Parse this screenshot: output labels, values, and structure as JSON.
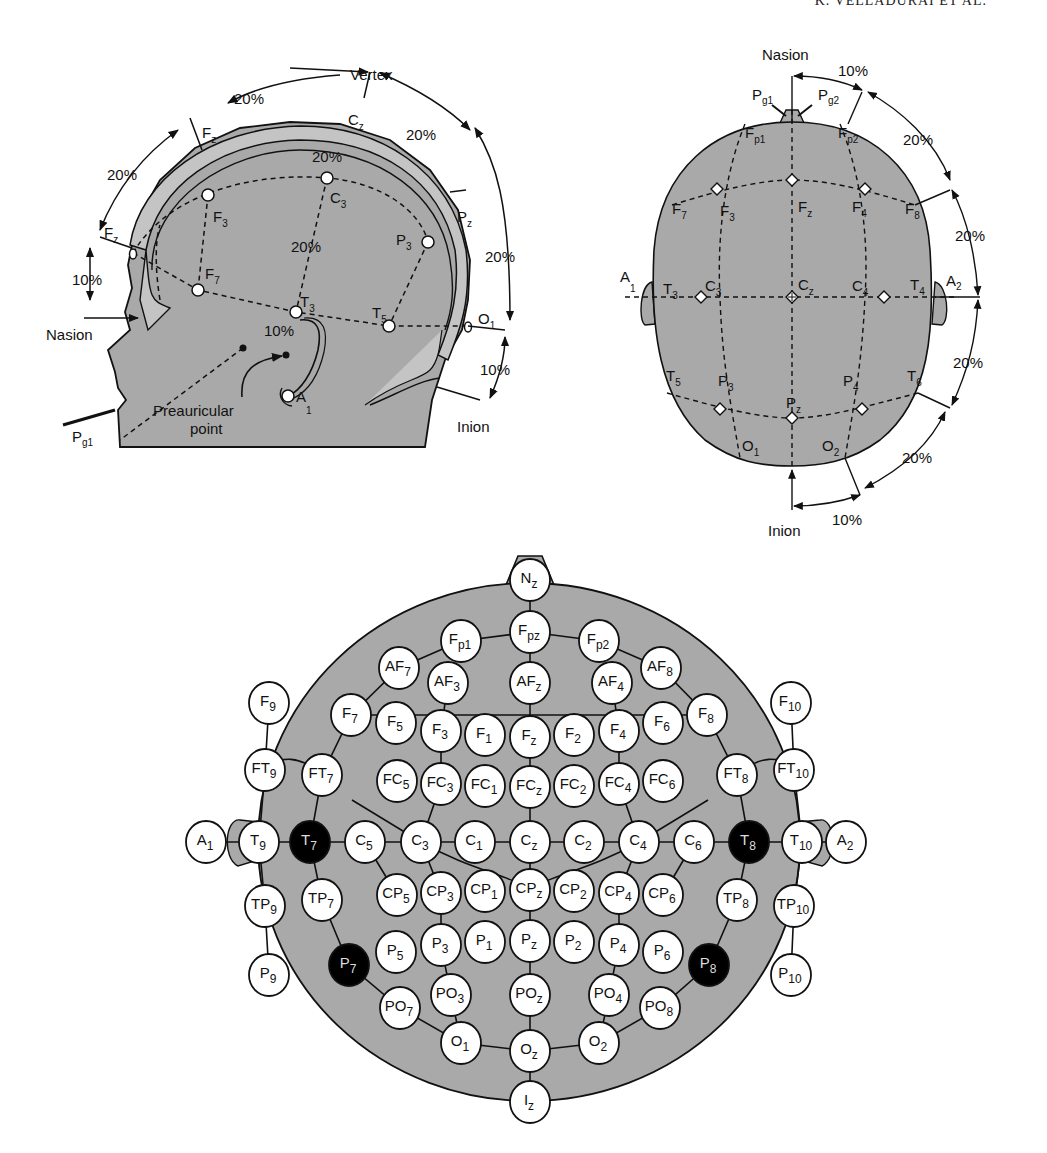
{
  "running_head": "K. VELLADURAI ET AL.",
  "colors": {
    "head_fill": "#a9a9a9",
    "head_fill_light": "#c4c4c4",
    "outline": "#111111",
    "electrode_fill": "#ffffff",
    "electrode_highlight": "#000000"
  },
  "side_view": {
    "title": "Vertex",
    "labels": {
      "vertex": "Vertex",
      "nasion": "Nasion",
      "inion": "Inion",
      "preauricular": "Preauricular",
      "preauricular2": "point",
      "pg1": "P",
      "pg1_sub": "g1",
      "a1": "A",
      "a1_sub": "1"
    },
    "percent_labels": [
      "20%",
      "20%",
      "20%",
      "20%",
      "10%",
      "20%",
      "20%",
      "10%",
      "10%"
    ],
    "electrodes": [
      {
        "id": "Fz_top",
        "label": "F",
        "sub": "z"
      },
      {
        "id": "Cz",
        "label": "C",
        "sub": "z"
      },
      {
        "id": "Pz",
        "label": "P",
        "sub": "z"
      },
      {
        "id": "Fpz",
        "label": "F",
        "sub": "z"
      },
      {
        "id": "F3",
        "label": "F",
        "sub": "3"
      },
      {
        "id": "C3",
        "label": "C",
        "sub": "3"
      },
      {
        "id": "P3",
        "label": "P",
        "sub": "3"
      },
      {
        "id": "F7",
        "label": "F",
        "sub": "7"
      },
      {
        "id": "T3",
        "label": "T",
        "sub": "3"
      },
      {
        "id": "T5",
        "label": "T",
        "sub": "5"
      },
      {
        "id": "O1",
        "label": "O",
        "sub": "1"
      }
    ]
  },
  "top_view": {
    "labels": {
      "nasion": "Nasion",
      "inion": "Inion",
      "pg1": "P",
      "pg1_sub": "g1",
      "pg2": "P",
      "pg2_sub": "g2",
      "a1": "A",
      "a1_sub": "1",
      "a2": "A",
      "a2_sub": "2"
    },
    "percent_labels": [
      "10%",
      "20%",
      "20%",
      "20%",
      "20%",
      "10%"
    ],
    "electrodes": [
      {
        "label": "F",
        "sub": "p1"
      },
      {
        "label": "F",
        "sub": "p2"
      },
      {
        "label": "F",
        "sub": "7"
      },
      {
        "label": "F",
        "sub": "3"
      },
      {
        "label": "F",
        "sub": "z"
      },
      {
        "label": "F",
        "sub": "4"
      },
      {
        "label": "F",
        "sub": "8"
      },
      {
        "label": "T",
        "sub": "3"
      },
      {
        "label": "C",
        "sub": "3"
      },
      {
        "label": "C",
        "sub": "z"
      },
      {
        "label": "C",
        "sub": "4"
      },
      {
        "label": "T",
        "sub": "4"
      },
      {
        "label": "T",
        "sub": "5"
      },
      {
        "label": "P",
        "sub": "3"
      },
      {
        "label": "P",
        "sub": "z"
      },
      {
        "label": "P",
        "sub": "4"
      },
      {
        "label": "T",
        "sub": "6"
      },
      {
        "label": "O",
        "sub": "1"
      },
      {
        "label": "O",
        "sub": "2"
      }
    ]
  },
  "ten_ten_map": {
    "electrodes": [
      {
        "l": "N",
        "s": "z",
        "x": 530,
        "y": 580
      },
      {
        "l": "F",
        "s": "pz",
        "x": 530,
        "y": 632
      },
      {
        "l": "F",
        "s": "p1",
        "x": 461,
        "y": 641
      },
      {
        "l": "F",
        "s": "p2",
        "x": 599,
        "y": 641
      },
      {
        "l": "AF",
        "s": "7",
        "x": 399,
        "y": 668
      },
      {
        "l": "AF",
        "s": "3",
        "x": 448,
        "y": 683
      },
      {
        "l": "AF",
        "s": "z",
        "x": 530,
        "y": 683
      },
      {
        "l": "AF",
        "s": "4",
        "x": 612,
        "y": 683
      },
      {
        "l": "AF",
        "s": "8",
        "x": 661,
        "y": 668
      },
      {
        "l": "F",
        "s": "9",
        "x": 269,
        "y": 703
      },
      {
        "l": "F",
        "s": "7",
        "x": 351,
        "y": 715
      },
      {
        "l": "F",
        "s": "5",
        "x": 396,
        "y": 723
      },
      {
        "l": "F",
        "s": "3",
        "x": 441,
        "y": 731
      },
      {
        "l": "F",
        "s": "1",
        "x": 485,
        "y": 735
      },
      {
        "l": "F",
        "s": "z",
        "x": 530,
        "y": 737
      },
      {
        "l": "F",
        "s": "2",
        "x": 574,
        "y": 735
      },
      {
        "l": "F",
        "s": "4",
        "x": 619,
        "y": 731
      },
      {
        "l": "F",
        "s": "6",
        "x": 663,
        "y": 723
      },
      {
        "l": "F",
        "s": "8",
        "x": 707,
        "y": 715
      },
      {
        "l": "F",
        "s": "10",
        "x": 791,
        "y": 703
      },
      {
        "l": "FT",
        "s": "9",
        "x": 265,
        "y": 770
      },
      {
        "l": "FT",
        "s": "7",
        "x": 322,
        "y": 775
      },
      {
        "l": "FC",
        "s": "5",
        "x": 397,
        "y": 781
      },
      {
        "l": "FC",
        "s": "3",
        "x": 441,
        "y": 784
      },
      {
        "l": "FC",
        "s": "1",
        "x": 485,
        "y": 786
      },
      {
        "l": "FC",
        "s": "z",
        "x": 530,
        "y": 787
      },
      {
        "l": "FC",
        "s": "2",
        "x": 574,
        "y": 786
      },
      {
        "l": "FC",
        "s": "4",
        "x": 619,
        "y": 784
      },
      {
        "l": "FC",
        "s": "6",
        "x": 663,
        "y": 781
      },
      {
        "l": "FT",
        "s": "8",
        "x": 737,
        "y": 775
      },
      {
        "l": "FT",
        "s": "10",
        "x": 794,
        "y": 770
      },
      {
        "l": "A",
        "s": "1",
        "x": 206,
        "y": 842
      },
      {
        "l": "T",
        "s": "9",
        "x": 259,
        "y": 842
      },
      {
        "l": "T",
        "s": "7",
        "x": 310,
        "y": 842,
        "dark": true
      },
      {
        "l": "C",
        "s": "5",
        "x": 365,
        "y": 842
      },
      {
        "l": "C",
        "s": "3",
        "x": 421,
        "y": 842
      },
      {
        "l": "C",
        "s": "1",
        "x": 475,
        "y": 842
      },
      {
        "l": "C",
        "s": "z",
        "x": 530,
        "y": 842
      },
      {
        "l": "C",
        "s": "2",
        "x": 584,
        "y": 842
      },
      {
        "l": "C",
        "s": "4",
        "x": 639,
        "y": 842
      },
      {
        "l": "C",
        "s": "6",
        "x": 694,
        "y": 842
      },
      {
        "l": "T",
        "s": "8",
        "x": 749,
        "y": 842,
        "dark": true
      },
      {
        "l": "T",
        "s": "10",
        "x": 802,
        "y": 842
      },
      {
        "l": "A",
        "s": "2",
        "x": 846,
        "y": 842
      },
      {
        "l": "TP",
        "s": "9",
        "x": 265,
        "y": 906
      },
      {
        "l": "TP",
        "s": "7",
        "x": 322,
        "y": 900
      },
      {
        "l": "CP",
        "s": "5",
        "x": 397,
        "y": 895
      },
      {
        "l": "CP",
        "s": "3",
        "x": 441,
        "y": 893
      },
      {
        "l": "CP",
        "s": "1",
        "x": 485,
        "y": 891
      },
      {
        "l": "CP",
        "s": "z",
        "x": 530,
        "y": 890
      },
      {
        "l": "CP",
        "s": "2",
        "x": 574,
        "y": 891
      },
      {
        "l": "CP",
        "s": "4",
        "x": 619,
        "y": 893
      },
      {
        "l": "CP",
        "s": "6",
        "x": 663,
        "y": 895
      },
      {
        "l": "TP",
        "s": "8",
        "x": 737,
        "y": 900
      },
      {
        "l": "TP",
        "s": "10",
        "x": 794,
        "y": 906
      },
      {
        "l": "P",
        "s": "7",
        "x": 349,
        "y": 965,
        "dark": true
      },
      {
        "l": "P",
        "s": "5",
        "x": 396,
        "y": 952
      },
      {
        "l": "P",
        "s": "3",
        "x": 441,
        "y": 945
      },
      {
        "l": "P",
        "s": "1",
        "x": 485,
        "y": 942
      },
      {
        "l": "P",
        "s": "z",
        "x": 530,
        "y": 941
      },
      {
        "l": "P",
        "s": "2",
        "x": 574,
        "y": 942
      },
      {
        "l": "P",
        "s": "4",
        "x": 619,
        "y": 945
      },
      {
        "l": "P",
        "s": "6",
        "x": 663,
        "y": 952
      },
      {
        "l": "P",
        "s": "8",
        "x": 709,
        "y": 965,
        "dark": true
      },
      {
        "l": "P",
        "s": "9",
        "x": 269,
        "y": 975
      },
      {
        "l": "P",
        "s": "10",
        "x": 791,
        "y": 975
      },
      {
        "l": "PO",
        "s": "7",
        "x": 400,
        "y": 1008
      },
      {
        "l": "PO",
        "s": "3",
        "x": 451,
        "y": 995
      },
      {
        "l": "PO",
        "s": "z",
        "x": 530,
        "y": 995
      },
      {
        "l": "PO",
        "s": "4",
        "x": 609,
        "y": 995
      },
      {
        "l": "PO",
        "s": "8",
        "x": 660,
        "y": 1008
      },
      {
        "l": "O",
        "s": "1",
        "x": 461,
        "y": 1043
      },
      {
        "l": "O",
        "s": "z",
        "x": 530,
        "y": 1051
      },
      {
        "l": "O",
        "s": "2",
        "x": 599,
        "y": 1043
      },
      {
        "l": "I",
        "s": "z",
        "x": 530,
        "y": 1102
      }
    ]
  }
}
